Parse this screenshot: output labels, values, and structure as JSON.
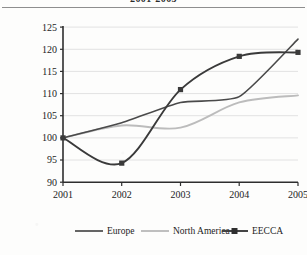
{
  "figure": {
    "title": "2001-2005",
    "title_visible_partially": true
  },
  "axes": {
    "ylabel": "Index (2001=100)",
    "xlabel": "",
    "yticks": [
      "90",
      "95",
      "100",
      "105",
      "110",
      "115",
      "120",
      "125"
    ],
    "xticks": [
      "2001",
      "2002",
      "2003",
      "2004",
      "2005"
    ]
  },
  "legend": {
    "position": "bottom",
    "items": [
      {
        "label": "Europe",
        "color": "#4a4a4a",
        "marker": "none"
      },
      {
        "label": "North America",
        "color": "#b9b9b9",
        "marker": "none"
      },
      {
        "label": "EECCA",
        "color": "#3a3a3a",
        "marker": "square"
      }
    ]
  },
  "colors": {
    "europe": "#4a4a4a",
    "north_america": "#bcbcbc",
    "eecca": "#3a3a3a",
    "grid": "#e2e2e2",
    "axis": "#2e2e2e"
  },
  "chart_data": {
    "type": "line",
    "title": "2001-2005",
    "xlabel": "",
    "ylabel": "Index (2001=100)",
    "categories": [
      "2001",
      "2002",
      "2003",
      "2004",
      "2005"
    ],
    "x": [
      2001,
      2002,
      2003,
      2004,
      2005
    ],
    "ylim": [
      90,
      125
    ],
    "xlim": [
      2001,
      2005
    ],
    "ytick_step": 5,
    "grid": "horizontal",
    "legend_position": "bottom",
    "series": [
      {
        "name": "Europe",
        "color": "#4a4a4a",
        "marker": "none",
        "values": [
          100.0,
          103.4,
          108.0,
          109.3,
          122.3
        ]
      },
      {
        "name": "North America",
        "color": "#bcbcbc",
        "marker": "none",
        "values": [
          100.0,
          102.8,
          102.3,
          108.0,
          109.6
        ]
      },
      {
        "name": "EECCA",
        "color": "#3a3a3a",
        "marker": "square",
        "values": [
          100.0,
          94.3,
          110.9,
          118.4,
          119.3
        ]
      }
    ],
    "annotations": []
  }
}
